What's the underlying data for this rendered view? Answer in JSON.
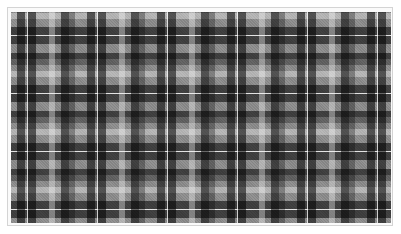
{
  "image": {
    "subject": "black, white and gray tartan plaid fabric pattern",
    "colors": {
      "base_gray": "#8c8c8c",
      "dark_stripe": "#000000",
      "light_stripe": "#ffffff",
      "frame_border": "#d4d4d4",
      "background": "#ffffff"
    }
  }
}
